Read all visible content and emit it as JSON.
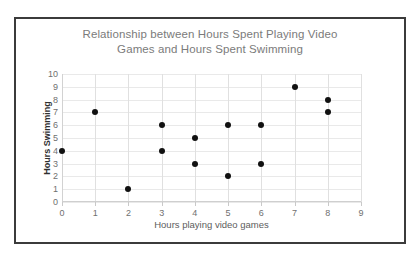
{
  "chart_data": {
    "type": "scatter",
    "title": "Relationship between Hours Spent Playing Video\nGames and Hours Spent Swimming",
    "xlabel": "Hours playing video games",
    "ylabel": "Hours Swimming",
    "xlim": [
      0,
      9
    ],
    "ylim": [
      0,
      10
    ],
    "xticks": [
      "0",
      "1",
      "2",
      "3",
      "4",
      "5",
      "6",
      "7",
      "8",
      "9"
    ],
    "yticks": [
      "0",
      "1",
      "2",
      "3",
      "4",
      "5",
      "6",
      "7",
      "8",
      "9",
      "10"
    ],
    "grid": true,
    "legend": false,
    "marker_color": "#111111",
    "points": [
      {
        "x": 0,
        "y": 4
      },
      {
        "x": 1,
        "y": 7
      },
      {
        "x": 2,
        "y": 1
      },
      {
        "x": 3,
        "y": 6
      },
      {
        "x": 3,
        "y": 4
      },
      {
        "x": 4,
        "y": 5
      },
      {
        "x": 4,
        "y": 3
      },
      {
        "x": 5,
        "y": 6
      },
      {
        "x": 5,
        "y": 2
      },
      {
        "x": 6,
        "y": 6
      },
      {
        "x": 6,
        "y": 3
      },
      {
        "x": 7,
        "y": 9
      },
      {
        "x": 8,
        "y": 8
      },
      {
        "x": 8,
        "y": 7
      }
    ]
  }
}
